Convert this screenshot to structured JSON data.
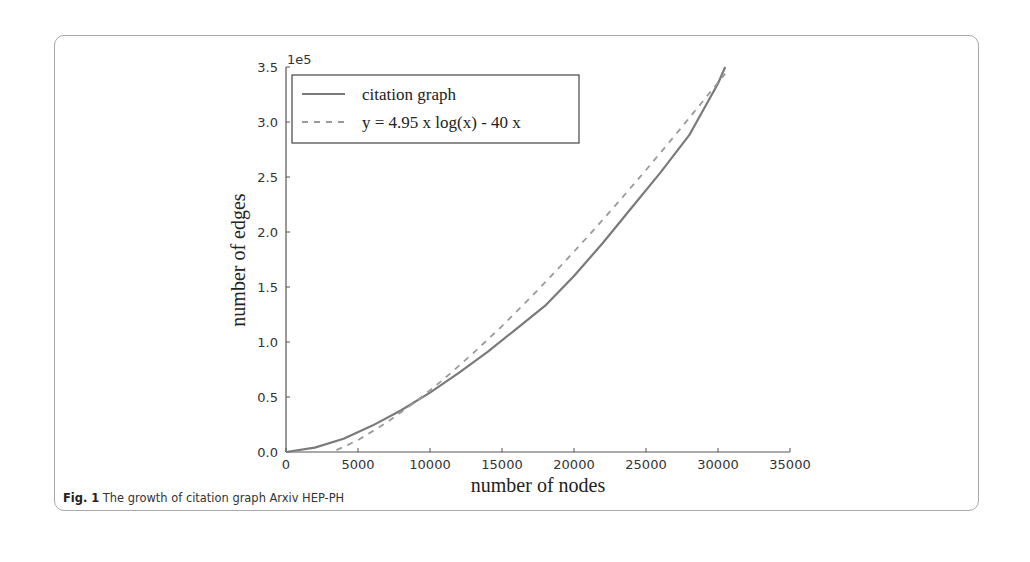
{
  "figure": {
    "label": "Fig. 1",
    "caption": "The growth of citation graph Arxiv HEP-PH"
  },
  "chart_data": {
    "type": "line",
    "title": "",
    "xlabel": "number of nodes",
    "ylabel": "number of edges",
    "y_offset_label": "1e5",
    "xlim": [
      0,
      35000
    ],
    "ylim": [
      0,
      350000
    ],
    "x_ticks": [
      "0",
      "5000",
      "10000",
      "15000",
      "20000",
      "25000",
      "30000",
      "35000"
    ],
    "y_ticks": [
      "0.0",
      "0.5",
      "1.0",
      "1.5",
      "2.0",
      "2.5",
      "3.0",
      "3.5"
    ],
    "grid": false,
    "legend_position": "upper left",
    "series": [
      {
        "name": "citation graph",
        "style": "solid",
        "color": "#7a7a7a",
        "x": [
          0,
          2000,
          4000,
          6000,
          8000,
          10000,
          12000,
          14000,
          16000,
          18000,
          20000,
          22000,
          24000,
          26000,
          28000,
          30000,
          30500
        ],
        "y": [
          0,
          4000,
          12000,
          24000,
          38000,
          54000,
          72000,
          91000,
          112000,
          133000,
          160000,
          190000,
          222000,
          254000,
          288000,
          335000,
          350000
        ]
      },
      {
        "name": "y = 4.95 x log(x) - 40 x",
        "style": "dashed",
        "color": "#9a9a9a",
        "x": [
          3500,
          5000,
          7000,
          9000,
          11000,
          13000,
          15000,
          17000,
          19000,
          21000,
          23000,
          25000,
          27000,
          29000,
          30500
        ],
        "y": [
          1700,
          10800,
          26800,
          45600,
          66700,
          89800,
          114500,
          140600,
          168000,
          196500,
          226000,
          256400,
          287600,
          319600,
          344000
        ]
      }
    ]
  }
}
